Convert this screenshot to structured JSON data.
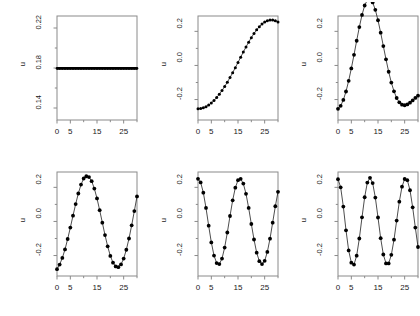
{
  "figure": {
    "type": "multi-panel-scatter-grid",
    "rows": 2,
    "cols": 3,
    "background": "#ffffff",
    "line_color": "#000000",
    "marker_color": "#000000",
    "axis_color": "#8a8a8a"
  },
  "chart_data": [
    {
      "type": "scatter",
      "panel": 1,
      "title": "",
      "xlabel": "",
      "ylabel": "u",
      "xlim": [
        0,
        30
      ],
      "ylim": [
        0.128,
        0.232
      ],
      "grid": false,
      "legend": null,
      "xticks": [
        0,
        5,
        15,
        25
      ],
      "xtick_labels": [
        "0",
        "5",
        "15",
        "25"
      ],
      "xminor_ticks": [
        10,
        20,
        30
      ],
      "yticks": [
        0.14,
        0.18,
        0.22
      ],
      "ytick_labels": [
        "0.14",
        "0.18",
        "0.22"
      ],
      "x": [
        0,
        1,
        2,
        3,
        4,
        5,
        6,
        7,
        8,
        9,
        10,
        11,
        12,
        13,
        14,
        15,
        16,
        17,
        18,
        19,
        20,
        21,
        22,
        23,
        24,
        25,
        26,
        27,
        28,
        29,
        30
      ],
      "values": [
        0.1796,
        0.1796,
        0.1796,
        0.1796,
        0.1796,
        0.1796,
        0.1796,
        0.1796,
        0.1796,
        0.1796,
        0.1796,
        0.1796,
        0.1796,
        0.1796,
        0.1796,
        0.1796,
        0.1796,
        0.1796,
        0.1796,
        0.1796,
        0.1796,
        0.1796,
        0.1796,
        0.1796,
        0.1796,
        0.1796,
        0.1796,
        0.1796,
        0.1796,
        0.1796,
        0.1796
      ]
    },
    {
      "type": "scatter",
      "panel": 2,
      "title": "",
      "xlabel": "",
      "ylabel": "u",
      "xlim": [
        0,
        30
      ],
      "ylim": [
        -0.32,
        0.29
      ],
      "grid": false,
      "legend": null,
      "xticks": [
        0,
        5,
        15,
        25
      ],
      "xtick_labels": [
        "0",
        "5",
        "15",
        "25"
      ],
      "xminor_ticks": [
        10,
        20,
        30
      ],
      "yticks": [
        -0.2,
        0.0,
        0.2
      ],
      "ytick_labels": [
        "-0.2",
        "0.0",
        "0.2"
      ],
      "x": [
        0,
        1,
        2,
        3,
        4,
        5,
        6,
        7,
        8,
        9,
        10,
        11,
        12,
        13,
        14,
        15,
        16,
        17,
        18,
        19,
        20,
        21,
        22,
        23,
        24,
        25,
        26,
        27,
        28,
        29,
        30
      ],
      "values": [
        -0.254,
        -0.2526,
        -0.2485,
        -0.2417,
        -0.2322,
        -0.2201,
        -0.2055,
        -0.1884,
        -0.169,
        -0.1474,
        -0.1237,
        -0.0982,
        -0.0711,
        -0.0426,
        -0.0129,
        0.0176,
        0.0483,
        0.0787,
        0.1083,
        0.1366,
        0.1631,
        0.1874,
        0.209,
        0.2276,
        0.2428,
        0.2544,
        0.2622,
        0.2661,
        0.2661,
        0.2622,
        0.2546
      ]
    },
    {
      "type": "scatter",
      "panel": 3,
      "title": "",
      "xlabel": "",
      "ylabel": "u",
      "xlim": [
        0,
        30
      ],
      "ylim": [
        -0.32,
        0.29
      ],
      "grid": false,
      "legend": null,
      "xticks": [
        0,
        5,
        15,
        25
      ],
      "xtick_labels": [
        "0",
        "5",
        "15",
        "25"
      ],
      "xminor_ticks": [
        10,
        20,
        30
      ],
      "yticks": [
        -0.2,
        0.0,
        0.2
      ],
      "ytick_labels": [
        "-0.2",
        "0.0",
        "0.2"
      ],
      "x": [
        0,
        1,
        2,
        3,
        4,
        5,
        6,
        7,
        8,
        9,
        10,
        11,
        12,
        13,
        14,
        15,
        16,
        17,
        18,
        19,
        20,
        21,
        22,
        23,
        24,
        25,
        26,
        27,
        28,
        29,
        30
      ],
      "values": [
        -0.2546,
        -0.2368,
        -0.2024,
        -0.1528,
        -0.0901,
        -0.0172,
        0.0625,
        0.1449,
        0.2249,
        0.2963,
        0.3516,
        0.3838,
        0.3896,
        0.3694,
        0.3262,
        0.265,
        0.1921,
        0.1137,
        0.0357,
        -0.0369,
        -0.1004,
        -0.1521,
        -0.1909,
        -0.2166,
        -0.2303,
        -0.2336,
        -0.2288,
        -0.2184,
        -0.205,
        -0.1908,
        -0.1776
      ]
    },
    {
      "type": "scatter",
      "panel": 4,
      "title": "",
      "xlabel": "",
      "ylabel": "u",
      "xlim": [
        0,
        30
      ],
      "ylim": [
        -0.32,
        0.29
      ],
      "grid": false,
      "legend": null,
      "xticks": [
        0,
        5,
        15,
        25
      ],
      "xtick_labels": [
        "0",
        "5",
        "15",
        "25"
      ],
      "xminor_ticks": [
        10,
        20,
        30
      ],
      "yticks": [
        -0.2,
        0.0,
        0.2
      ],
      "ytick_labels": [
        "-0.2",
        "0.0",
        "0.2"
      ],
      "x": [
        0,
        1,
        2,
        3,
        4,
        5,
        6,
        7,
        8,
        9,
        10,
        11,
        12,
        13,
        14,
        15,
        16,
        17,
        18,
        19,
        20,
        21,
        22,
        23,
        24,
        25,
        26,
        27,
        28,
        29,
        30
      ],
      "values": [
        -0.28,
        -0.253,
        -0.214,
        -0.164,
        -0.103,
        -0.036,
        0.034,
        0.102,
        0.164,
        0.216,
        0.252,
        0.265,
        0.26,
        0.236,
        0.193,
        0.135,
        0.066,
        -0.007,
        -0.08,
        -0.146,
        -0.202,
        -0.242,
        -0.264,
        -0.268,
        -0.252,
        -0.218,
        -0.166,
        -0.1,
        -0.023,
        0.061,
        0.147
      ]
    },
    {
      "type": "scatter",
      "panel": 5,
      "title": "",
      "xlabel": "",
      "ylabel": "u",
      "xlim": [
        0,
        30
      ],
      "ylim": [
        -0.32,
        0.29
      ],
      "grid": false,
      "legend": null,
      "xticks": [
        0,
        5,
        15,
        25
      ],
      "xtick_labels": [
        "0",
        "5",
        "15",
        "25"
      ],
      "xminor_ticks": [
        10,
        20,
        30
      ],
      "yticks": [
        -0.2,
        0.0,
        0.2
      ],
      "ytick_labels": [
        "-0.2",
        "0.0",
        "0.2"
      ],
      "x": [
        0,
        1,
        2,
        3,
        4,
        5,
        6,
        7,
        8,
        9,
        10,
        11,
        12,
        13,
        14,
        15,
        16,
        17,
        18,
        19,
        20,
        21,
        22,
        23,
        24,
        25,
        26,
        27,
        28,
        29,
        30
      ],
      "values": [
        0.25,
        0.229,
        0.169,
        0.079,
        -0.025,
        -0.123,
        -0.2,
        -0.244,
        -0.25,
        -0.218,
        -0.153,
        -0.065,
        0.032,
        0.124,
        0.198,
        0.242,
        0.25,
        0.222,
        0.162,
        0.079,
        -0.015,
        -0.106,
        -0.183,
        -0.233,
        -0.25,
        -0.231,
        -0.179,
        -0.101,
        -0.007,
        0.089,
        0.174
      ]
    },
    {
      "type": "scatter",
      "panel": 6,
      "title": "",
      "xlabel": "",
      "ylabel": "u",
      "xlim": [
        0,
        30
      ],
      "ylim": [
        -0.32,
        0.29
      ],
      "grid": false,
      "legend": null,
      "xticks": [
        0,
        5,
        15,
        25
      ],
      "xtick_labels": [
        "0",
        "5",
        "15",
        "25"
      ],
      "xminor_ticks": [
        10,
        20,
        30
      ],
      "yticks": [
        -0.2,
        0.0,
        0.2
      ],
      "ytick_labels": [
        "-0.2",
        "0.0",
        "0.2"
      ],
      "x": [
        0,
        1,
        2,
        3,
        4,
        5,
        6,
        7,
        8,
        9,
        10,
        11,
        12,
        13,
        14,
        15,
        16,
        17,
        18,
        19,
        20,
        21,
        22,
        23,
        24,
        25,
        26,
        27,
        28,
        29,
        30
      ],
      "values": [
        0.248,
        0.2,
        0.087,
        -0.052,
        -0.17,
        -0.242,
        -0.253,
        -0.201,
        -0.1,
        0.024,
        0.142,
        0.228,
        0.256,
        0.225,
        0.14,
        0.023,
        -0.098,
        -0.194,
        -0.246,
        -0.246,
        -0.196,
        -0.107,
        0.005,
        0.116,
        0.204,
        0.249,
        0.242,
        0.183,
        0.083,
        -0.036,
        -0.15
      ]
    }
  ]
}
